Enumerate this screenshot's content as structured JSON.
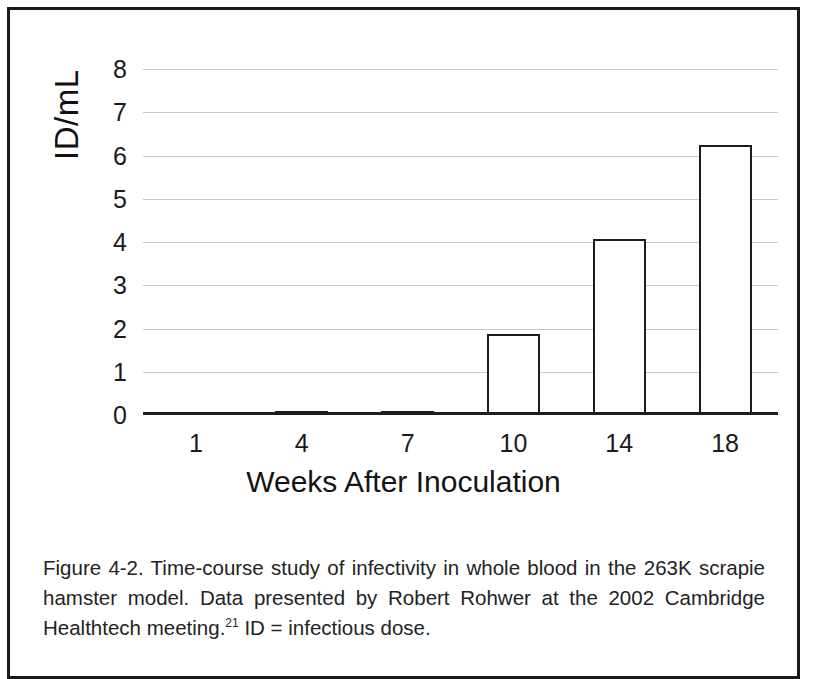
{
  "figure": {
    "caption_part1": "Figure 4-2. Time-course study of infectivity in whole blood in the 263K scrapie hamster model. Data presented by Robert Rohwer at the 2002 Cambridge Healthtech meeting.",
    "caption_superscript": "21",
    "caption_part2": " ID = infectious dose."
  },
  "chart_data": {
    "type": "bar",
    "title": "",
    "xlabel": "Weeks After Inoculation",
    "ylabel": "ID/mL",
    "categories": [
      "1",
      "4",
      "7",
      "10",
      "14",
      "18"
    ],
    "values": [
      0,
      0.05,
      0.05,
      1.88,
      4.07,
      6.25
    ],
    "ylim": [
      0,
      8
    ],
    "yticks": [
      "0",
      "1",
      "2",
      "3",
      "4",
      "5",
      "6",
      "7",
      "8"
    ],
    "ytick_values": [
      0,
      1,
      2,
      3,
      4,
      5,
      6,
      7,
      8
    ],
    "grid": true,
    "legend": "none",
    "bar_fill": "#ffffff",
    "bar_edge": "#1d1d1d",
    "gridline_color": "#c9c9c9",
    "axis_color": "#1d1d1d"
  }
}
